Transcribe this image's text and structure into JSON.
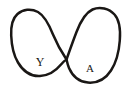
{
  "figure": {
    "kind": "hand-drawn-diagram",
    "background_color": "#ffffff",
    "ink_color": "#1a1715",
    "stroke_width": 2.5,
    "canvas": {
      "width": 129,
      "height": 86
    },
    "crossing_point": {
      "x": 66,
      "y": 59
    },
    "loops": [
      {
        "id": "left-loop",
        "label": "Y",
        "label_position": {
          "x": 40,
          "y": 66
        },
        "bounds": {
          "x": 11,
          "y": 9,
          "width": 59,
          "height": 68
        }
      },
      {
        "id": "right-loop",
        "label": "A",
        "label_position": {
          "x": 90,
          "y": 72
        },
        "bounds": {
          "x": 62,
          "y": 8,
          "width": 58,
          "height": 75
        }
      }
    ]
  }
}
